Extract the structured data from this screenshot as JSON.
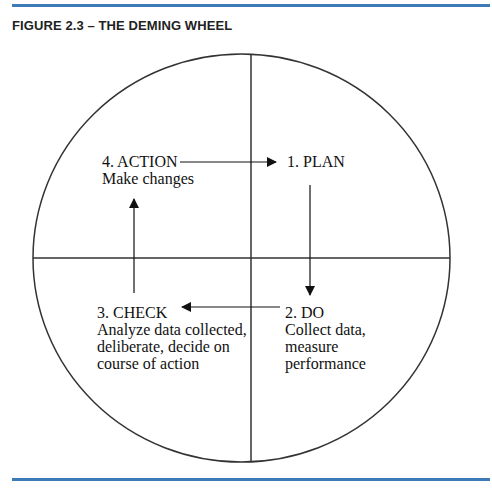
{
  "figure": {
    "title": "FIGURE 2.3 – THE DEMING WHEEL",
    "rule_color": "#3d7ab8"
  },
  "wheel": {
    "plan": {
      "heading": "1. PLAN"
    },
    "do": {
      "heading": "2. DO",
      "lines": [
        "Collect data,",
        "measure",
        "performance"
      ]
    },
    "check": {
      "heading": "3. CHECK",
      "lines": [
        "Analyze data collected,",
        "deliberate, decide on",
        "course of action"
      ]
    },
    "action": {
      "heading": "4. ACTION",
      "lines": [
        "Make changes"
      ]
    }
  }
}
